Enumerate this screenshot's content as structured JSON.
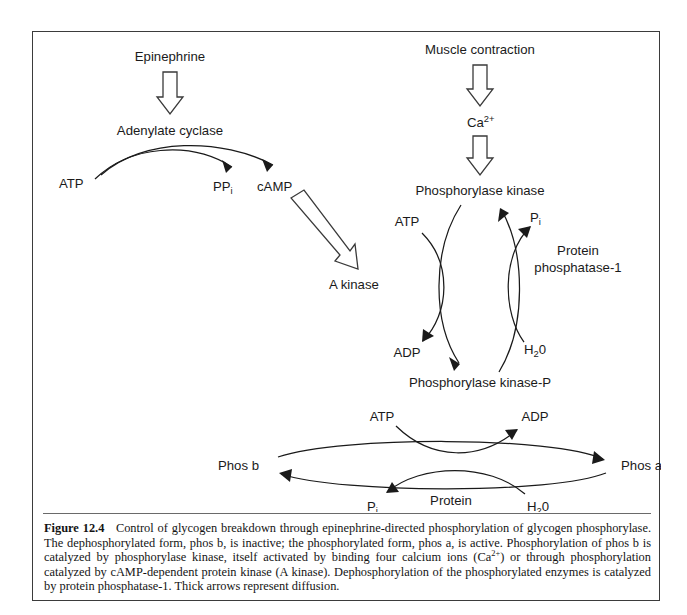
{
  "figure": {
    "number": "Figure 12.4",
    "caption_text": "Control of glycogen breakdown through epinephrine-directed phosphorylation of glycogen phosphorylase. The dephosphorylated form, phos b, is inactive; the phosphorylated form, phos a, is active. Phosphorylation of phos b is catalyzed by phosphorylase kinase, itself activated by binding four calcium ions (Ca2+) or through phosphorylation catalyzed by cAMP-dependent protein kinase (A kinase). Dephosphorylation of the phosphorylated enzymes is catalyzed by protein phosphatase-1. Thick arrows represent diffusion.",
    "caption_part_1": "Control of glycogen breakdown through epinephrine-directed phosphorylation of glycogen phosphorylase. The dephosphorylated form, phos b, is inactive; the phosphorylated form, phos a, is active. Phosphorylation of phos b is catalyzed by phosphorylase kinase, itself activated by binding four calcium ions (Ca",
    "caption_sup": "2+",
    "caption_part_2": ") or through phosphorylation catalyzed by cAMP-dependent protein kinase (A kinase). Dephosphorylation of the phosphorylated enzymes is catalyzed by protein phosphatase-1. Thick arrows represent diffusion."
  },
  "colors": {
    "ink": "#1a1a1a",
    "frame": "#3b3b3b",
    "paper": "#ffffff",
    "rule": "#6a6a6a"
  },
  "diagram": {
    "epinephrine_pathway": {
      "stimulus": "Epinephrine",
      "enzyme": "Adenylate cyclase",
      "substrate": "ATP",
      "byproduct": "PP",
      "byproduct_sub": "i",
      "product": "cAMP",
      "target": "A kinase"
    },
    "calcium_pathway": {
      "stimulus": "Muscle contraction",
      "ion": "Ca",
      "ion_sup": "2+",
      "enzyme": "Phosphorylase kinase"
    },
    "kinase_cycle": {
      "top_label": "Phosphorylase kinase",
      "bottom_label": "Phosphorylase kinase-P",
      "donor": "ATP",
      "donor_product": "ADP",
      "phosphatase_name_line1": "Protein",
      "phosphatase_name_line2": "phosphatase-1",
      "water": "H",
      "water_sub": "2",
      "water_tail": "0",
      "phosphate": "P",
      "phosphate_sub": "i"
    },
    "phosphorylase_cycle": {
      "left_label_prefix": "Phos ",
      "left_label_italic": "b",
      "right_label_prefix": "Phos ",
      "right_label_italic": "a",
      "donor": "ATP",
      "donor_product": "ADP",
      "phosphatase_name_line1": "Protein",
      "phosphatase_name_line2": "phosphatase-1",
      "water": "H",
      "water_sub": "2",
      "water_tail": "0",
      "phosphate": "P",
      "phosphate_sub": "i"
    }
  }
}
